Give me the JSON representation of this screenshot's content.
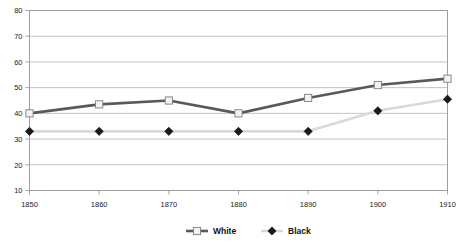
{
  "chart_data": {
    "type": "line",
    "title": "",
    "xlabel": "",
    "ylabel": "",
    "categories": [
      "1850",
      "1860",
      "1870",
      "1880",
      "1890",
      "1900",
      "1910"
    ],
    "x": [
      1850,
      1860,
      1870,
      1880,
      1890,
      1900,
      1910
    ],
    "series": [
      {
        "name": "White",
        "values": [
          40,
          43.5,
          45,
          40,
          46,
          51,
          53.5
        ],
        "line_color": "#595959",
        "marker": "square",
        "marker_fill": "#f2f2f2",
        "marker_edge": "#7f7f7f"
      },
      {
        "name": "Black",
        "values": [
          33,
          33,
          33,
          33,
          33,
          41,
          45.5
        ],
        "line_color": "#d9d9d9",
        "marker": "diamond",
        "marker_fill": "#1a1a1a",
        "marker_edge": "#1a1a1a"
      }
    ],
    "ylim": [
      10,
      80
    ],
    "yticks": [
      10,
      20,
      30,
      40,
      50,
      60,
      70,
      80
    ],
    "ytick_labels": [
      "10",
      "20",
      "30",
      "40",
      "50",
      "60",
      "70",
      "80"
    ],
    "xtick_labels": [
      "1850",
      "1860",
      "1870",
      "1880",
      "1890",
      "1900",
      "1910"
    ],
    "grid": true,
    "grid_axis": "y",
    "legend_position": "bottom",
    "legend": [
      {
        "label": "White",
        "marker": "square",
        "line_color": "#595959",
        "marker_fill": "#f2f2f2"
      },
      {
        "label": "Black",
        "marker": "diamond",
        "line_color": "#d9d9d9",
        "marker_fill": "#1a1a1a"
      }
    ],
    "plot_background": "#ffffff",
    "grid_color": "#a6a6a6",
    "axis_color": "#8c8c8c"
  }
}
